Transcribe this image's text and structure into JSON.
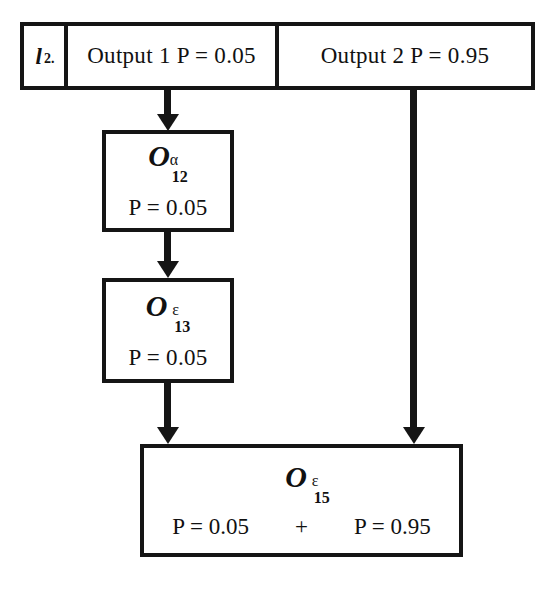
{
  "diagram": {
    "stroke_color": "#151515",
    "background_color": "#ffffff"
  },
  "top_bar": {
    "index_letter": "l",
    "index_subscript": "2.",
    "output1": "Output 1 P = 0.05",
    "output2": "Output 2 P = 0.95"
  },
  "nodes": {
    "o12": {
      "symbol": "O",
      "superscript": "α",
      "subscript": "12",
      "probability": "P = 0.05"
    },
    "o13": {
      "symbol": "O",
      "superscript": "ε",
      "subscript": "13",
      "probability": "P = 0.05"
    },
    "o15": {
      "symbol": "O",
      "superscript": "ε",
      "subscript": "15",
      "probability_left": "P = 0.05",
      "plus": "+",
      "probability_right": "P = 0.95"
    }
  },
  "connectors": {
    "bar_to_o12": "arrow-down",
    "o12_to_o13": "arrow-down",
    "o13_to_o15": "arrow-down",
    "bar_to_o15": "arrow-down"
  }
}
